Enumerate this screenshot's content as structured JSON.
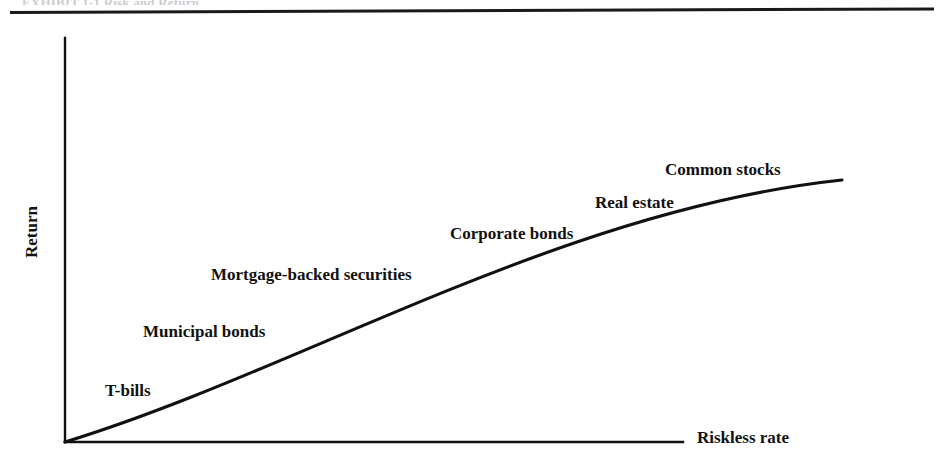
{
  "figure": {
    "cropped_header_text": "EXHIBIT 1-1  Risk and Return",
    "axis_y_label": "Return",
    "axis_x_label": "Riskless rate"
  },
  "chart_data": {
    "type": "line",
    "title": "",
    "subtitle": "",
    "xlabel": "Riskless rate",
    "ylabel": "Return",
    "grid": false,
    "legend_position": "none",
    "axis_style": "two-axis-no-ticks",
    "xlim": [
      0,
      100
    ],
    "ylim": [
      0,
      100
    ],
    "annotations": [
      {
        "label": "T-bills",
        "x": 12,
        "y": 13,
        "label_x": 105,
        "label_y": 381
      },
      {
        "label": "Municipal bonds",
        "x": 24,
        "y": 27,
        "label_x": 143,
        "label_y": 322
      },
      {
        "label": "Mortgage-backed securities",
        "x": 38,
        "y": 41,
        "label_x": 211,
        "label_y": 265
      },
      {
        "label": "Corporate bonds",
        "x": 55,
        "y": 55,
        "label_x": 450,
        "label_y": 224
      },
      {
        "label": "Real estate",
        "x": 70,
        "y": 66,
        "label_x": 595,
        "label_y": 193
      },
      {
        "label": "Common stocks",
        "x": 88,
        "y": 78,
        "label_x": 665,
        "label_y": 160
      }
    ],
    "series": [
      {
        "name": "Risk-return tradeoff",
        "shape": "concave-increasing",
        "x": [
          0,
          10,
          20,
          30,
          40,
          50,
          60,
          70,
          80,
          90,
          100
        ],
        "y": [
          0,
          11,
          21,
          31,
          40,
          48,
          56,
          63,
          70,
          76,
          81
        ]
      }
    ],
    "curve_pixel_path": {
      "start": [
        65,
        442
      ],
      "control_1": [
        300,
        370
      ],
      "control_2": [
        560,
        210
      ],
      "end": [
        842,
        180
      ]
    },
    "axes_pixels": {
      "y_axis": {
        "x": 65,
        "y_top": 38,
        "y_bottom": 442
      },
      "x_axis": {
        "y": 442,
        "x_left": 65,
        "x_right": 683
      }
    }
  },
  "colors": {
    "ink": "#111111",
    "background": "#ffffff",
    "rule": "#1a1a1a",
    "faint_text": "#b9bbc2"
  }
}
